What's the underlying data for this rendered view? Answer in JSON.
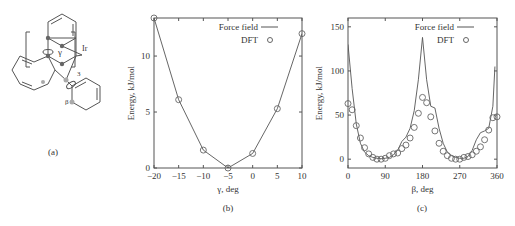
{
  "panels": {
    "a": {
      "caption": "(a)",
      "labels": {
        "gamma": "γ",
        "beta": "β",
        "metal": "Ir",
        "count": "3"
      }
    },
    "b": {
      "caption": "(b)"
    },
    "c": {
      "caption": "(c)"
    }
  },
  "chart_data": [
    {
      "id": "b",
      "type": "line",
      "title": "",
      "xlabel": "γ, deg",
      "ylabel": "Energy, kJ/mol",
      "xlim": [
        -20,
        10
      ],
      "ylim": [
        0,
        13.4
      ],
      "xticks": [
        -20,
        -15,
        -10,
        -5,
        0,
        5,
        10
      ],
      "yticks": [
        0,
        5,
        10
      ],
      "grid": false,
      "legend": {
        "position": "upper right",
        "entries": [
          "Force field",
          "DFT"
        ]
      },
      "series": [
        {
          "name": "Force field",
          "style": "line",
          "x": [
            -20,
            -15,
            -10,
            -5,
            0,
            5,
            10
          ],
          "y": [
            13.4,
            6.1,
            1.6,
            0.0,
            1.3,
            5.3,
            12.0
          ]
        },
        {
          "name": "DFT",
          "style": "markers",
          "x": [
            -20,
            -15,
            -10,
            -5,
            0,
            5,
            10
          ],
          "y": [
            13.4,
            6.1,
            1.6,
            0.0,
            1.3,
            5.3,
            12.0
          ]
        }
      ]
    },
    {
      "id": "c",
      "type": "line",
      "title": "",
      "xlabel": "β, deg",
      "ylabel": "Energy, kJ/mol",
      "xlim": [
        0,
        360
      ],
      "ylim": [
        -10,
        160
      ],
      "xticks": [
        0,
        90,
        180,
        270,
        360
      ],
      "yticks": [
        0,
        50,
        100,
        150
      ],
      "grid": false,
      "legend": {
        "position": "upper right",
        "entries": [
          "Force field",
          "DFT"
        ]
      },
      "series": [
        {
          "name": "Force field",
          "style": "line",
          "x": [
            0,
            10,
            20,
            30,
            40,
            50,
            60,
            70,
            80,
            90,
            100,
            110,
            120,
            130,
            140,
            150,
            160,
            170,
            180,
            190,
            200,
            210,
            220,
            230,
            240,
            250,
            260,
            270,
            280,
            290,
            300,
            310,
            320,
            330,
            340,
            350,
            355
          ],
          "y": [
            130,
            80,
            40,
            18,
            8,
            4,
            2,
            1,
            0.5,
            1,
            2,
            5,
            10,
            20,
            25,
            35,
            55,
            90,
            138,
            90,
            60,
            58,
            35,
            18,
            8,
            4,
            2,
            1,
            1,
            3,
            10,
            22,
            30,
            32,
            35,
            60,
            105
          ]
        },
        {
          "name": "DFT",
          "style": "markers",
          "x": [
            0,
            10,
            20,
            30,
            40,
            50,
            60,
            70,
            80,
            90,
            100,
            110,
            120,
            130,
            140,
            150,
            160,
            170,
            180,
            190,
            200,
            210,
            220,
            230,
            240,
            250,
            260,
            270,
            280,
            290,
            300,
            310,
            320,
            330,
            340,
            350,
            360
          ],
          "y": [
            63,
            56,
            38,
            24,
            13,
            6,
            2,
            0,
            0,
            1,
            4,
            6,
            7,
            12,
            16,
            24,
            36,
            52,
            70,
            64,
            48,
            32,
            18,
            9,
            4,
            1,
            0,
            0,
            2,
            3,
            5,
            9,
            14,
            22,
            33,
            47,
            48
          ]
        }
      ]
    }
  ]
}
